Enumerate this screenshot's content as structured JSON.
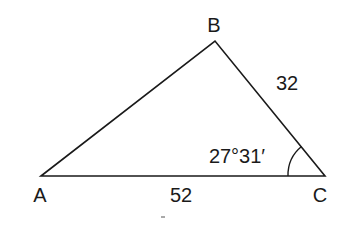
{
  "diagram": {
    "type": "triangle",
    "vertices": {
      "A": {
        "label": "A"
      },
      "B": {
        "label": "B"
      },
      "C": {
        "label": "C"
      }
    },
    "sides": {
      "AC": {
        "label": "52"
      },
      "BC": {
        "label": "32"
      }
    },
    "angles": {
      "C": {
        "label": "27°31′"
      }
    },
    "colors": {
      "stroke": "#1a1a1a",
      "background": "#ffffff"
    }
  }
}
